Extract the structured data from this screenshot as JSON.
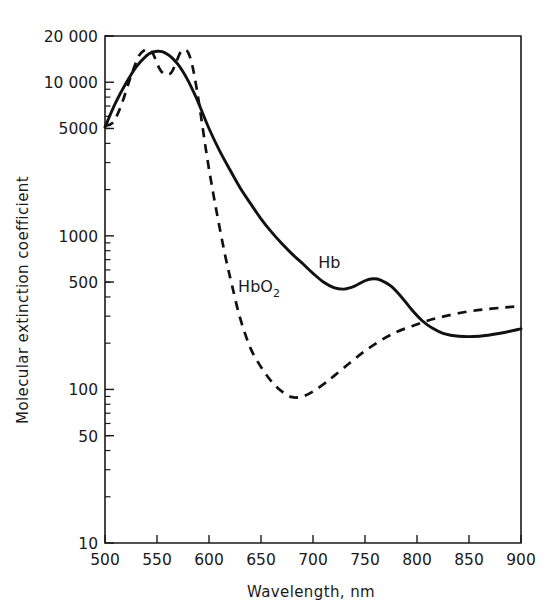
{
  "chart_data": {
    "type": "line",
    "title": "",
    "xlabel": "Wavelength, nm",
    "ylabel": "Molecular extinction coefficient",
    "xlim": [
      500,
      900
    ],
    "ylim": [
      10,
      20000
    ],
    "yscale": "log",
    "xscale": "linear",
    "grid": false,
    "legend_position": "inline-annotation",
    "xticks": [
      500,
      550,
      600,
      650,
      700,
      750,
      800,
      850,
      900
    ],
    "xtick_labels": [
      "500",
      "550",
      "600",
      "650",
      "700",
      "750",
      "800",
      "850",
      "900"
    ],
    "yticks": [
      10,
      50,
      100,
      500,
      1000,
      5000,
      10000,
      20000
    ],
    "ytick_labels": [
      "10",
      "50",
      "100",
      "500",
      "1000",
      "5000",
      "10 000",
      "20 000"
    ],
    "annotations": [
      {
        "text": "Hb",
        "x": 705,
        "y": 620
      },
      {
        "text": "HbO2",
        "text_display": "HbO₂",
        "x": 628,
        "y": 430
      }
    ],
    "series": [
      {
        "name": "Hb",
        "label": "Hb",
        "style": "solid",
        "color": "#111111",
        "x": [
          500,
          510,
          520,
          530,
          540,
          545,
          550,
          555,
          560,
          565,
          570,
          575,
          580,
          585,
          590,
          600,
          610,
          620,
          630,
          640,
          650,
          660,
          670,
          680,
          690,
          700,
          710,
          720,
          730,
          740,
          750,
          758,
          765,
          775,
          785,
          795,
          805,
          815,
          825,
          840,
          860,
          880,
          900
        ],
        "y": [
          5100,
          7300,
          9800,
          12600,
          14900,
          15600,
          15900,
          15800,
          15200,
          14300,
          13100,
          11700,
          10200,
          8700,
          7300,
          5000,
          3600,
          2700,
          2050,
          1620,
          1290,
          1060,
          890,
          760,
          660,
          570,
          500,
          460,
          450,
          470,
          510,
          525,
          515,
          470,
          400,
          330,
          280,
          250,
          232,
          222,
          222,
          232,
          248
        ]
      },
      {
        "name": "HbO2",
        "label": "HbO₂",
        "style": "dashed",
        "color": "#111111",
        "x": [
          500,
          508,
          516,
          524,
          532,
          538,
          542,
          546,
          552,
          556,
          560,
          564,
          568,
          572,
          576,
          580,
          584,
          588,
          592,
          598,
          604,
          610,
          616,
          622,
          630,
          640,
          650,
          660,
          670,
          680,
          690,
          700,
          710,
          720,
          735,
          750,
          765,
          780,
          795,
          810,
          825,
          845,
          865,
          885,
          900
        ],
        "y": [
          5200,
          5500,
          7200,
          10500,
          14600,
          16200,
          16300,
          15400,
          12400,
          11400,
          11200,
          11600,
          13300,
          15400,
          16300,
          15600,
          12800,
          9200,
          6200,
          3300,
          1900,
          1150,
          720,
          480,
          290,
          185,
          140,
          113,
          97,
          89,
          90,
          97,
          108,
          122,
          148,
          178,
          208,
          236,
          258,
          280,
          298,
          318,
          332,
          342,
          348
        ]
      }
    ]
  },
  "axes": {
    "x_title": "Wavelength, nm",
    "y_title": "Molecular extinction coefficient"
  }
}
